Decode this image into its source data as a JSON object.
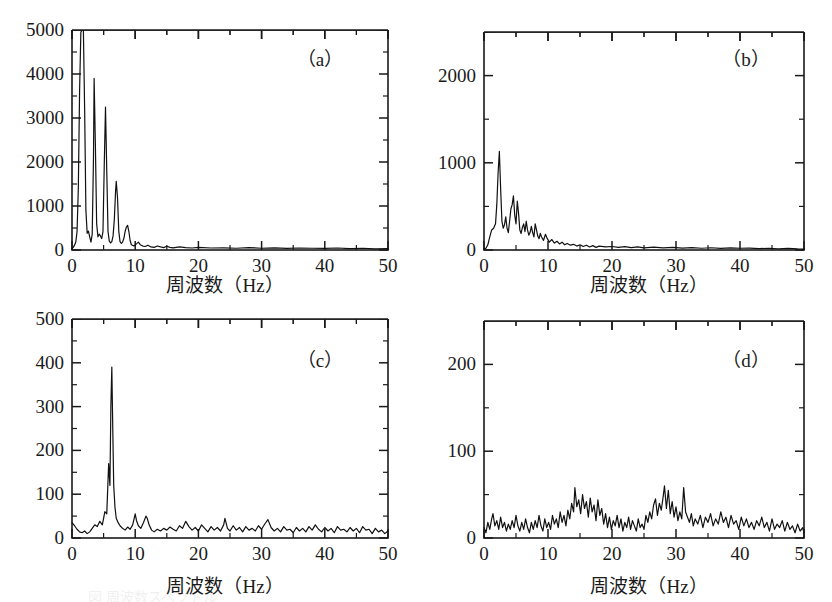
{
  "figure": {
    "background": "#ffffff",
    "ink": "#1a1a1a",
    "trace_color": "#111111",
    "caption_partial": "図 周波数スペクトル"
  },
  "shared": {
    "xlabel": "周波数（Hz）",
    "xlim": [
      0,
      50
    ],
    "xticks": [
      0,
      10,
      20,
      30,
      40,
      50
    ],
    "xticklabels": [
      "0",
      "10",
      "20",
      "30",
      "40",
      "50"
    ],
    "xminor_step": 5,
    "grid": false,
    "legend": "none"
  },
  "chart_data": [
    {
      "id": "a",
      "type": "line",
      "tag": "（a）",
      "title": "",
      "xlabel": "周波数（Hz）",
      "ylabel": "",
      "xlim": [
        0,
        50
      ],
      "ylim": [
        0,
        5000
      ],
      "yticks": [
        0,
        1000,
        2000,
        3000,
        4000,
        5000
      ],
      "yticklabels": [
        "0",
        "1000",
        "2000",
        "3000",
        "4000",
        "5000"
      ],
      "yminor_step": 500,
      "xticks": [
        0,
        10,
        20,
        30,
        40,
        50
      ],
      "xminor_step": 5,
      "description": "Sharp harmonic spectrum; fundamental near 1.8 Hz clipped at top of axis, decaying harmonic spikes at ~3.5, 5.3, 7.0, 8.8 Hz, flat near zero beyond 12 Hz.",
      "peaks": [
        {
          "x": 1.8,
          "y": 5000
        },
        {
          "x": 3.5,
          "y": 3900
        },
        {
          "x": 5.3,
          "y": 3250
        },
        {
          "x": 7.0,
          "y": 1560
        },
        {
          "x": 8.8,
          "y": 560
        },
        {
          "x": 2.6,
          "y": 430
        },
        {
          "x": 4.4,
          "y": 360
        },
        {
          "x": 10.5,
          "y": 180
        }
      ],
      "x": [
        0.0,
        0.2,
        0.4,
        0.6,
        0.8,
        1.0,
        1.2,
        1.4,
        1.6,
        1.8,
        2.0,
        2.2,
        2.4,
        2.6,
        2.8,
        3.0,
        3.2,
        3.4,
        3.5,
        3.7,
        3.9,
        4.1,
        4.3,
        4.5,
        4.7,
        4.9,
        5.1,
        5.3,
        5.5,
        5.7,
        5.9,
        6.1,
        6.3,
        6.5,
        6.7,
        6.9,
        7.0,
        7.2,
        7.4,
        7.6,
        7.8,
        8.0,
        8.2,
        8.4,
        8.6,
        8.8,
        9.0,
        9.2,
        9.4,
        9.8,
        10.2,
        10.5,
        10.8,
        11.2,
        11.6,
        12.0,
        12.5,
        13.0,
        13.5,
        14.0,
        14.5,
        15.0,
        15.5,
        16.0,
        17.0,
        18.0,
        19.0,
        20.0,
        22.0,
        24.0,
        26.0,
        28.0,
        30.0,
        32.0,
        34.0,
        36.0,
        38.0,
        40.0,
        42.0,
        44.0,
        46.0,
        48.0,
        50.0
      ],
      "y": [
        30,
        60,
        110,
        180,
        420,
        1400,
        3600,
        4950,
        5000,
        5000,
        3200,
        900,
        380,
        430,
        300,
        180,
        360,
        2100,
        3900,
        2400,
        600,
        300,
        360,
        320,
        260,
        420,
        1900,
        3250,
        1800,
        420,
        200,
        160,
        190,
        320,
        700,
        1350,
        1560,
        1200,
        430,
        190,
        150,
        180,
        260,
        420,
        520,
        560,
        420,
        210,
        120,
        90,
        140,
        180,
        120,
        90,
        80,
        110,
        70,
        60,
        90,
        70,
        55,
        85,
        60,
        50,
        70,
        55,
        45,
        60,
        45,
        50,
        40,
        55,
        40,
        50,
        35,
        45,
        40,
        35,
        45,
        30,
        40,
        25,
        30
      ]
    },
    {
      "id": "b",
      "type": "line",
      "tag": "（b）",
      "title": "",
      "xlabel": "周波数（Hz）",
      "ylabel": "",
      "xlim": [
        0,
        50
      ],
      "ylim": [
        0,
        2500
      ],
      "yticks": [
        0,
        1000,
        2000
      ],
      "yticklabels": [
        "0",
        "1000",
        "2000"
      ],
      "yminor_step": 500,
      "xticks": [
        0,
        10,
        20,
        30,
        40,
        50
      ],
      "xminor_step": 5,
      "description": "Broadened low-frequency band; dominant narrow spike near 2.4 Hz reaching ~1130, secondary cluster 4-6 Hz around 600, noise floor decaying to near zero past 15 Hz.",
      "peaks": [
        {
          "x": 2.4,
          "y": 1130
        },
        {
          "x": 4.6,
          "y": 620
        },
        {
          "x": 5.2,
          "y": 560
        },
        {
          "x": 3.4,
          "y": 380
        },
        {
          "x": 6.6,
          "y": 330
        },
        {
          "x": 8.0,
          "y": 300
        }
      ],
      "x": [
        0.0,
        0.3,
        0.6,
        0.9,
        1.2,
        1.5,
        1.8,
        2.0,
        2.2,
        2.4,
        2.6,
        2.8,
        3.0,
        3.2,
        3.4,
        3.6,
        3.8,
        4.0,
        4.2,
        4.4,
        4.6,
        4.8,
        5.0,
        5.2,
        5.4,
        5.6,
        5.8,
        6.0,
        6.2,
        6.4,
        6.6,
        6.8,
        7.0,
        7.2,
        7.4,
        7.6,
        7.8,
        8.0,
        8.2,
        8.4,
        8.6,
        8.8,
        9.0,
        9.3,
        9.6,
        9.9,
        10.2,
        10.6,
        11.0,
        11.4,
        11.8,
        12.2,
        12.6,
        13.0,
        13.5,
        14.0,
        14.5,
        15.0,
        15.5,
        16.0,
        16.5,
        17.0,
        17.5,
        18.0,
        19.0,
        20.0,
        21.0,
        22.0,
        23.0,
        24.0,
        25.0,
        26.5,
        28.0,
        29.5,
        31.0,
        32.5,
        34.0,
        35.5,
        37.0,
        38.5,
        40.0,
        41.5,
        43.0,
        44.5,
        46.0,
        47.5,
        49.0,
        50.0
      ],
      "y": [
        10,
        20,
        60,
        150,
        230,
        250,
        300,
        520,
        880,
        1130,
        700,
        330,
        250,
        290,
        380,
        250,
        200,
        330,
        470,
        520,
        620,
        400,
        300,
        560,
        420,
        230,
        190,
        260,
        300,
        210,
        330,
        230,
        170,
        200,
        270,
        200,
        150,
        300,
        230,
        160,
        130,
        190,
        150,
        110,
        180,
        130,
        90,
        120,
        80,
        100,
        70,
        90,
        60,
        75,
        55,
        65,
        45,
        60,
        40,
        55,
        35,
        50,
        30,
        45,
        35,
        40,
        30,
        38,
        28,
        35,
        25,
        32,
        25,
        30,
        22,
        28,
        20,
        26,
        18,
        24,
        20,
        22,
        16,
        20,
        14,
        18,
        12,
        10
      ]
    },
    {
      "id": "c",
      "type": "line",
      "tag": "（c）",
      "title": "",
      "xlabel": "周波数（Hz）",
      "ylabel": "",
      "xlim": [
        0,
        50
      ],
      "ylim": [
        0,
        500
      ],
      "yticks": [
        0,
        100,
        200,
        300,
        400,
        500
      ],
      "yticklabels": [
        "0",
        "100",
        "200",
        "300",
        "400",
        "500"
      ],
      "yminor_step": 50,
      "xticks": [
        0,
        10,
        20,
        30,
        40,
        50
      ],
      "xminor_step": 5,
      "description": "Single very sharp peak at ~6.3 Hz reaching ~390, riding on a low broadband noise floor of roughly 10-30 across the whole band, with small bumps near 10-12, 18, 24 and 31 Hz.",
      "peaks": [
        {
          "x": 6.3,
          "y": 390
        },
        {
          "x": 5.9,
          "y": 170
        },
        {
          "x": 10.2,
          "y": 55
        },
        {
          "x": 11.8,
          "y": 50
        },
        {
          "x": 24.2,
          "y": 45
        },
        {
          "x": 31.0,
          "y": 42
        },
        {
          "x": 18.0,
          "y": 38
        }
      ],
      "x": [
        0.0,
        0.4,
        0.8,
        1.2,
        1.6,
        2.0,
        2.4,
        2.8,
        3.2,
        3.6,
        4.0,
        4.4,
        4.8,
        5.2,
        5.5,
        5.8,
        6.0,
        6.15,
        6.3,
        6.45,
        6.6,
        6.8,
        7.0,
        7.3,
        7.6,
        8.0,
        8.4,
        8.8,
        9.2,
        9.6,
        10.0,
        10.2,
        10.5,
        10.9,
        11.3,
        11.7,
        11.9,
        12.2,
        12.6,
        13.0,
        13.5,
        14.0,
        14.5,
        15.0,
        15.5,
        16.0,
        16.5,
        17.0,
        17.5,
        18.0,
        18.5,
        19.0,
        19.5,
        20.0,
        20.5,
        21.0,
        21.5,
        22.0,
        22.5,
        23.0,
        23.5,
        24.0,
        24.2,
        24.6,
        25.0,
        25.5,
        26.0,
        26.5,
        27.0,
        27.5,
        28.0,
        28.5,
        29.0,
        29.5,
        30.0,
        30.5,
        31.0,
        31.5,
        32.0,
        32.5,
        33.0,
        33.5,
        34.0,
        34.5,
        35.0,
        35.5,
        36.0,
        36.5,
        37.0,
        37.5,
        38.0,
        38.5,
        39.0,
        39.5,
        40.0,
        40.5,
        41.0,
        41.5,
        42.0,
        42.5,
        43.0,
        43.5,
        44.0,
        44.5,
        45.0,
        45.5,
        46.0,
        46.5,
        47.0,
        47.5,
        48.0,
        48.5,
        49.0,
        49.5,
        50.0
      ],
      "y": [
        35,
        28,
        20,
        14,
        12,
        16,
        10,
        14,
        22,
        30,
        26,
        38,
        30,
        60,
        55,
        170,
        120,
        300,
        390,
        250,
        120,
        70,
        45,
        35,
        28,
        22,
        18,
        25,
        20,
        30,
        55,
        40,
        28,
        22,
        35,
        50,
        45,
        30,
        18,
        14,
        20,
        16,
        22,
        18,
        25,
        20,
        16,
        28,
        22,
        38,
        26,
        18,
        24,
        16,
        30,
        22,
        14,
        26,
        18,
        24,
        16,
        30,
        45,
        22,
        16,
        28,
        18,
        24,
        14,
        26,
        18,
        22,
        16,
        28,
        20,
        32,
        42,
        24,
        16,
        22,
        14,
        26,
        18,
        20,
        12,
        24,
        16,
        22,
        14,
        26,
        18,
        30,
        20,
        14,
        24,
        16,
        22,
        12,
        26,
        18,
        20,
        14,
        24,
        16,
        22,
        12,
        26,
        18,
        20,
        10,
        22,
        14,
        18,
        10,
        16
      ]
    },
    {
      "id": "d",
      "type": "line",
      "tag": "（d）",
      "title": "",
      "xlabel": "周波数（Hz）",
      "ylabel": "",
      "xlim": [
        0,
        50
      ],
      "ylim": [
        0,
        250
      ],
      "yticks": [
        0,
        100,
        200
      ],
      "yticklabels": [
        "0",
        "100",
        "200"
      ],
      "yminor_step": 50,
      "xticks": [
        0,
        10,
        20,
        30,
        40,
        50
      ],
      "xminor_step": 5,
      "description": "Broadband noise with no dominant single line; elevated bands around 13-18 Hz and 26-32 Hz reaching about 55-60, baseline noise roughly 5-25 elsewhere.",
      "peaks": [
        {
          "x": 14.2,
          "y": 58
        },
        {
          "x": 15.4,
          "y": 50
        },
        {
          "x": 28.2,
          "y": 60
        },
        {
          "x": 28.8,
          "y": 55
        },
        {
          "x": 31.2,
          "y": 58
        },
        {
          "x": 26.8,
          "y": 45
        },
        {
          "x": 1.4,
          "y": 28
        }
      ],
      "x": [
        0.0,
        0.3,
        0.6,
        0.9,
        1.2,
        1.4,
        1.7,
        2.0,
        2.3,
        2.6,
        2.9,
        3.2,
        3.5,
        3.8,
        4.1,
        4.4,
        4.7,
        5.0,
        5.3,
        5.6,
        5.9,
        6.2,
        6.5,
        6.8,
        7.1,
        7.4,
        7.7,
        8.0,
        8.3,
        8.6,
        8.9,
        9.2,
        9.5,
        9.8,
        10.1,
        10.4,
        10.7,
        11.0,
        11.3,
        11.6,
        11.9,
        12.2,
        12.5,
        12.8,
        13.1,
        13.4,
        13.7,
        14.0,
        14.2,
        14.5,
        14.8,
        15.1,
        15.4,
        15.7,
        16.0,
        16.3,
        16.6,
        16.9,
        17.2,
        17.5,
        17.8,
        18.1,
        18.4,
        18.7,
        19.0,
        19.3,
        19.6,
        19.9,
        20.2,
        20.5,
        20.8,
        21.1,
        21.4,
        21.7,
        22.0,
        22.3,
        22.6,
        22.9,
        23.2,
        23.5,
        23.8,
        24.1,
        24.4,
        24.7,
        25.0,
        25.3,
        25.6,
        25.9,
        26.2,
        26.5,
        26.8,
        27.1,
        27.4,
        27.7,
        28.0,
        28.2,
        28.5,
        28.8,
        29.1,
        29.4,
        29.7,
        30.0,
        30.3,
        30.6,
        30.9,
        31.2,
        31.5,
        31.8,
        32.1,
        32.4,
        32.7,
        33.0,
        33.4,
        33.8,
        34.2,
        34.6,
        35.0,
        35.4,
        35.8,
        36.2,
        36.6,
        37.0,
        37.4,
        37.8,
        38.2,
        38.6,
        39.0,
        39.4,
        39.8,
        40.2,
        40.6,
        41.0,
        41.4,
        41.8,
        42.2,
        42.6,
        43.0,
        43.4,
        43.8,
        44.2,
        44.6,
        45.0,
        45.4,
        45.8,
        46.2,
        46.6,
        47.0,
        47.4,
        47.8,
        48.2,
        48.6,
        49.0,
        49.4,
        49.8,
        50.0
      ],
      "y": [
        12,
        6,
        18,
        10,
        22,
        28,
        14,
        20,
        10,
        24,
        12,
        18,
        8,
        16,
        10,
        20,
        12,
        26,
        14,
        8,
        18,
        10,
        22,
        12,
        6,
        18,
        10,
        20,
        12,
        26,
        14,
        8,
        22,
        12,
        18,
        10,
        26,
        16,
        22,
        12,
        30,
        18,
        26,
        14,
        32,
        22,
        40,
        30,
        58,
        36,
        44,
        28,
        50,
        34,
        42,
        24,
        46,
        30,
        38,
        20,
        44,
        26,
        34,
        16,
        28,
        12,
        24,
        10,
        20,
        14,
        26,
        12,
        22,
        8,
        18,
        12,
        24,
        10,
        20,
        14,
        8,
        22,
        12,
        16,
        10,
        26,
        18,
        30,
        22,
        38,
        45,
        26,
        40,
        32,
        48,
        60,
        34,
        55,
        28,
        42,
        24,
        36,
        20,
        30,
        22,
        58,
        30,
        24,
        18,
        28,
        14,
        22,
        16,
        26,
        12,
        24,
        18,
        28,
        14,
        22,
        16,
        30,
        18,
        24,
        12,
        26,
        16,
        20,
        10,
        24,
        14,
        22,
        12,
        18,
        10,
        20,
        14,
        24,
        12,
        18,
        8,
        22,
        10,
        16,
        12,
        20,
        8,
        18,
        10,
        14,
        6,
        16,
        8,
        12,
        6,
        10
      ]
    }
  ]
}
